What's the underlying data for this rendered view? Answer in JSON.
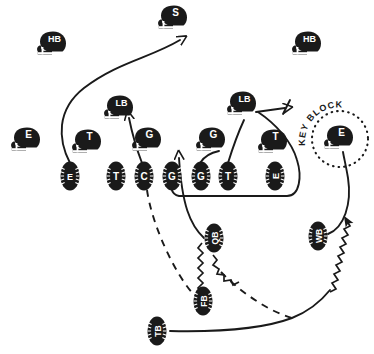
{
  "diagram": {
    "annotation": {
      "key_block_label": "KEY BLOCK"
    },
    "defense": {
      "helmet_players": [
        {
          "id": "def-s",
          "label": "S",
          "x": 174,
          "y": 17,
          "role": "safety"
        },
        {
          "id": "def-hb-left",
          "label": "HB",
          "x": 53,
          "y": 43,
          "role": "halfback-defensive-back"
        },
        {
          "id": "def-hb-right",
          "label": "HB",
          "x": 308,
          "y": 43,
          "role": "halfback-defensive-back"
        },
        {
          "id": "def-lb-left",
          "label": "LB",
          "x": 120,
          "y": 107,
          "role": "linebacker"
        },
        {
          "id": "def-lb-right",
          "label": "LB",
          "x": 243,
          "y": 103,
          "role": "linebacker"
        },
        {
          "id": "def-e-left",
          "label": "E",
          "x": 27,
          "y": 139,
          "role": "end"
        },
        {
          "id": "def-t-left",
          "label": "T",
          "x": 88,
          "y": 141,
          "role": "tackle"
        },
        {
          "id": "def-g-left",
          "label": "G",
          "x": 148,
          "y": 139,
          "role": "guard"
        },
        {
          "id": "def-g-right",
          "label": "G",
          "x": 212,
          "y": 139,
          "role": "guard"
        },
        {
          "id": "def-t-right",
          "label": "T",
          "x": 274,
          "y": 141,
          "role": "tackle"
        },
        {
          "id": "def-e-key",
          "label": "E",
          "x": 340,
          "y": 137,
          "role": "end-key-block"
        }
      ]
    },
    "offense": {
      "line_players": [
        {
          "id": "off-e-left",
          "label": "E",
          "x": 70,
          "y": 176,
          "vertical": true
        },
        {
          "id": "off-t-left",
          "label": "T",
          "x": 116,
          "y": 176,
          "vertical": false
        },
        {
          "id": "off-c-left",
          "label": "C",
          "x": 144,
          "y": 176,
          "vertical": false
        },
        {
          "id": "off-g-mid",
          "label": "G",
          "x": 172,
          "y": 176,
          "vertical": false
        },
        {
          "id": "off-g-right",
          "label": "G",
          "x": 201,
          "y": 176,
          "vertical": false
        },
        {
          "id": "off-t-right",
          "label": "T",
          "x": 228,
          "y": 176,
          "vertical": false
        },
        {
          "id": "off-e-right",
          "label": "E",
          "x": 275,
          "y": 176,
          "vertical": true
        }
      ],
      "backfield_players": [
        {
          "id": "off-qb",
          "label": "QB",
          "x": 214,
          "y": 238,
          "vertical": true
        },
        {
          "id": "off-wb",
          "label": "WB",
          "x": 318,
          "y": 236,
          "vertical": true
        },
        {
          "id": "off-fb",
          "label": "FB",
          "x": 203,
          "y": 301,
          "vertical": true
        },
        {
          "id": "off-tb",
          "label": "TB",
          "x": 157,
          "y": 331,
          "vertical": true
        }
      ]
    },
    "colors": {
      "ink": "#1a1a1a",
      "paper": "#ffffff",
      "label_text": "#ffffff"
    },
    "routes": [
      {
        "id": "route-e-to-safety",
        "style": "solid",
        "arrow": "open",
        "desc": "left end releases upfield toward safety"
      },
      {
        "id": "route-c-to-lb",
        "style": "solid",
        "arrow": "open",
        "desc": "center blocks left linebacker"
      },
      {
        "id": "route-qb-to-gap",
        "style": "solid",
        "arrow": "open",
        "desc": "quarterback drive through guard gap"
      },
      {
        "id": "route-pull-right",
        "style": "solid",
        "arrow": "open",
        "desc": "pulling lineman sweeps behind line to right linebacker"
      },
      {
        "id": "route-c-dash",
        "style": "dashed",
        "arrow": "none",
        "desc": "center to fullback dashed path"
      },
      {
        "id": "route-fb-dash",
        "style": "dashed",
        "arrow": "none",
        "desc": "fullback dashed path to right"
      },
      {
        "id": "route-tb-sweep",
        "style": "solid",
        "arrow": "none",
        "desc": "tailback sweeps right"
      },
      {
        "id": "route-tb-motion-zigzag",
        "style": "zigzag",
        "arrow": "solid",
        "desc": "tailback motion zigzag upfield right"
      },
      {
        "id": "route-qb-fb-zigzag",
        "style": "zigzag",
        "arrow": "none",
        "desc": "quarterback to fullback handoff zigzag"
      },
      {
        "id": "route-wb-to-key",
        "style": "solid",
        "arrow": "none",
        "desc": "wingback to key block end"
      }
    ]
  }
}
